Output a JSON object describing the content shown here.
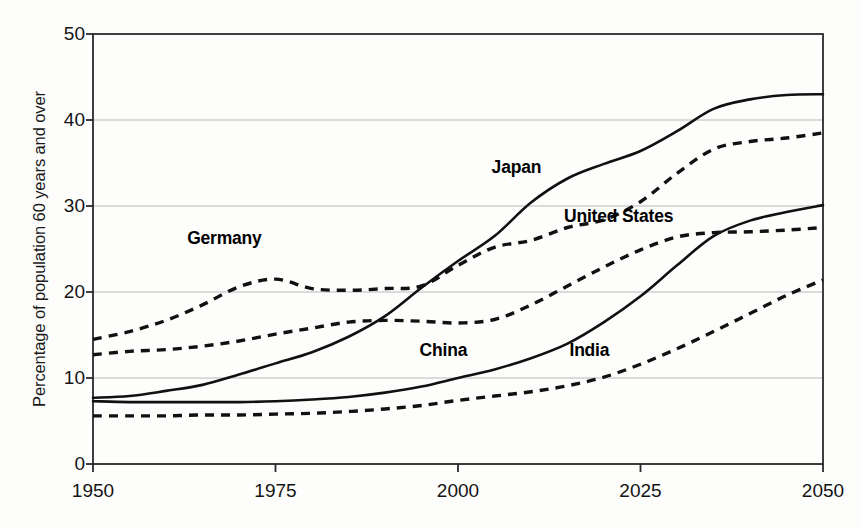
{
  "chart_data": {
    "type": "line",
    "title": "",
    "subtitle": "",
    "xlabel": "",
    "ylabel": "Percentage of population 60 years and over",
    "xlim": [
      1950,
      2050
    ],
    "ylim": [
      0,
      50
    ],
    "xticks": [
      "1950",
      "1975",
      "2000",
      "2025",
      "2050"
    ],
    "xtick_values": [
      1950,
      1975,
      2000,
      2025,
      2050
    ],
    "yticks": [
      "0",
      "10",
      "20",
      "30",
      "40",
      "50"
    ],
    "ytick_values": [
      0,
      10,
      20,
      30,
      40,
      50
    ],
    "grid": "horizontal",
    "legend": "inline-labels",
    "line_color": "#111111",
    "x": [
      1950,
      1955,
      1960,
      1965,
      1970,
      1975,
      1980,
      1985,
      1990,
      1995,
      2000,
      2005,
      2010,
      2015,
      2020,
      2025,
      2030,
      2035,
      2040,
      2045,
      2050
    ],
    "series": [
      {
        "name": "Japan",
        "style": "solid",
        "label_x": 2008,
        "label_y": 34.5,
        "values": [
          7.7,
          7.9,
          8.5,
          9.2,
          10.4,
          11.7,
          13.0,
          14.8,
          17.2,
          20.5,
          23.6,
          26.5,
          30.4,
          33.2,
          34.9,
          36.4,
          38.7,
          41.3,
          42.4,
          42.9,
          43.0
        ]
      },
      {
        "name": "Germany",
        "style": "dashed",
        "label_x": 1968,
        "label_y": 26.3,
        "values": [
          14.5,
          15.4,
          16.7,
          18.5,
          20.6,
          21.5,
          20.4,
          20.2,
          20.4,
          20.7,
          23.1,
          25.2,
          26.0,
          27.5,
          28.4,
          30.5,
          33.8,
          36.6,
          37.5,
          37.9,
          38.5
        ]
      },
      {
        "name": "United States",
        "style": "dashed",
        "label_x": 2022,
        "label_y": 28.8,
        "values": [
          12.7,
          13.1,
          13.3,
          13.7,
          14.3,
          15.1,
          15.8,
          16.5,
          16.7,
          16.6,
          16.4,
          16.8,
          18.5,
          20.7,
          22.9,
          24.9,
          26.4,
          26.9,
          27.0,
          27.2,
          27.5
        ]
      },
      {
        "name": "China",
        "style": "solid",
        "label_x": 1998,
        "label_y": 13.3,
        "values": [
          7.3,
          7.2,
          7.2,
          7.2,
          7.2,
          7.3,
          7.5,
          7.8,
          8.3,
          9.0,
          10.0,
          11.0,
          12.3,
          14.0,
          16.5,
          19.5,
          23.1,
          26.5,
          28.3,
          29.3,
          30.1
        ]
      },
      {
        "name": "India",
        "style": "dashed",
        "label_x": 2018,
        "label_y": 13.3,
        "values": [
          5.6,
          5.6,
          5.6,
          5.7,
          5.7,
          5.8,
          5.9,
          6.1,
          6.4,
          6.8,
          7.4,
          7.9,
          8.4,
          9.1,
          10.1,
          11.6,
          13.4,
          15.4,
          17.5,
          19.6,
          21.4
        ]
      }
    ]
  },
  "axis": {
    "y_title": "Percentage of population 60 years and over"
  }
}
